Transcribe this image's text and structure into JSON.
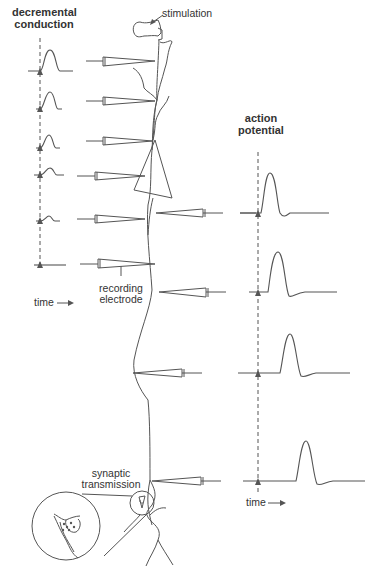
{
  "labels": {
    "stimulation": "stimulation",
    "decremental_title_1": "decremental",
    "decremental_title_2": "conduction",
    "action_title_1": "action",
    "action_title_2": "potential",
    "recording_1": "recording",
    "recording_2": "electrode",
    "time_left": "time",
    "time_right": "time",
    "synaptic_1": "synaptic",
    "synaptic_2": "transmission"
  },
  "decremental_conduction": {
    "traces": [
      {
        "baseline_y": 45,
        "peak_height": 22
      },
      {
        "baseline_y": 109,
        "peak_height": 17
      },
      {
        "baseline_y": 148,
        "peak_height": 12
      },
      {
        "baseline_y": 176,
        "peak_height": 7
      },
      {
        "baseline_y": 221,
        "peak_height": 5
      },
      {
        "baseline_y": 264,
        "peak_height": 0
      }
    ]
  },
  "action_potential": {
    "traces": [
      {
        "baseline_y": 212,
        "delay": 0
      },
      {
        "baseline_y": 292,
        "delay": 10
      },
      {
        "baseline_y": 373,
        "delay": 22
      },
      {
        "baseline_y": 480,
        "delay": 38
      }
    ]
  },
  "colors": {
    "line": "#555555",
    "text": "#333333",
    "background": "#ffffff"
  }
}
